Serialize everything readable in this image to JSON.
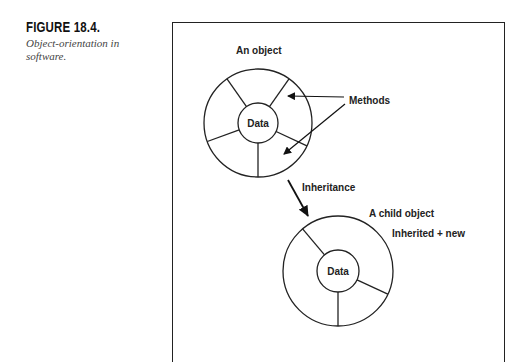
{
  "caption": {
    "figure_number": "FIGURE 18.4.",
    "description": "Object-orientation in software."
  },
  "diagram": {
    "parent_object": {
      "title": "An object",
      "core_label": "Data",
      "methods_label": "Methods"
    },
    "relationship_label": "Inheritance",
    "child_object": {
      "title": "A child object",
      "subtitle": "Inherited + new",
      "core_label": "Data"
    }
  }
}
